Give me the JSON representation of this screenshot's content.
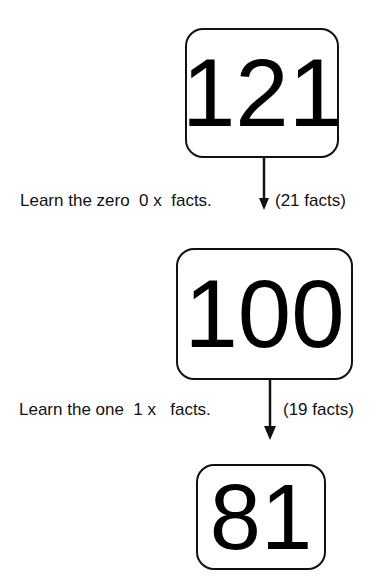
{
  "diagram": {
    "nodes": [
      {
        "id": "box1",
        "value": "121"
      },
      {
        "id": "box2",
        "value": "100"
      },
      {
        "id": "box3",
        "value": "81"
      }
    ],
    "steps": [
      {
        "text": "Learn the zero  0 x  facts.",
        "count": "(21 facts)"
      },
      {
        "text": "Learn the one  1 x   facts.",
        "count": "(19 facts)"
      }
    ]
  }
}
